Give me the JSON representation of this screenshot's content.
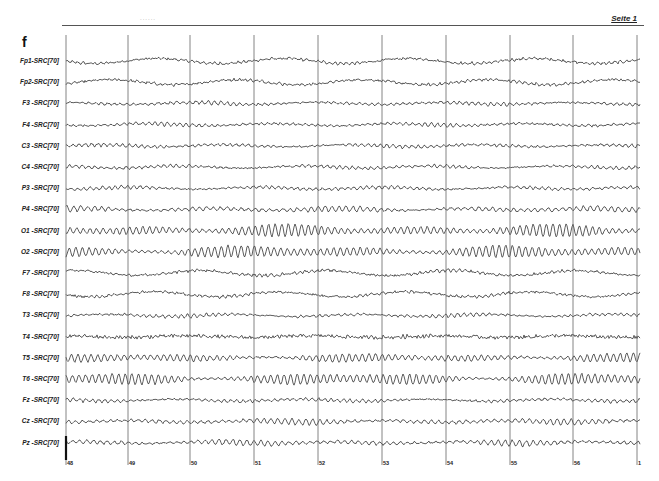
{
  "header": {
    "page_label": "Seite 1",
    "dots": "......"
  },
  "panel": {
    "letter": "f"
  },
  "montage": {
    "channels": [
      {
        "label": "Fp1-SRC[70]",
        "type": "slow"
      },
      {
        "label": "Fp2-SRC[70]",
        "type": "slow"
      },
      {
        "label": "F3 -SRC[70]",
        "type": "low"
      },
      {
        "label": "F4 -SRC[70]",
        "type": "low"
      },
      {
        "label": "C3 -SRC[70]",
        "type": "low"
      },
      {
        "label": "C4 -SRC[70]",
        "type": "low"
      },
      {
        "label": "P3 -SRC[70]",
        "type": "low"
      },
      {
        "label": "P4 -SRC[70]",
        "type": "mid"
      },
      {
        "label": "O1 -SRC[70]",
        "type": "alpha"
      },
      {
        "label": "O2 -SRC[70]",
        "type": "alpha"
      },
      {
        "label": "F7 -SRC[70]",
        "type": "slow"
      },
      {
        "label": "F8 -SRC[70]",
        "type": "slow"
      },
      {
        "label": "T3 -SRC[70]",
        "type": "low"
      },
      {
        "label": "T4 -SRC[70]",
        "type": "noisy"
      },
      {
        "label": "T5 -SRC[70]",
        "type": "alpha-mid"
      },
      {
        "label": "T6 -SRC[70]",
        "type": "alpha"
      },
      {
        "label": "Fz -SRC[70]",
        "type": "low"
      },
      {
        "label": "Cz -SRC[70]",
        "type": "mid"
      },
      {
        "label": "Pz -SRC[70]",
        "type": "mid"
      }
    ]
  },
  "time_axis": {
    "markers": [
      {
        "label": "48",
        "x": 66
      },
      {
        "label": "49",
        "x": 128
      },
      {
        "label": "50",
        "x": 190
      },
      {
        "label": "51",
        "x": 254
      },
      {
        "label": "52",
        "x": 318
      },
      {
        "label": "53",
        "x": 382
      },
      {
        "label": "54",
        "x": 446
      },
      {
        "label": "55",
        "x": 510
      },
      {
        "label": "56",
        "x": 573
      },
      {
        "label": "1",
        "x": 637
      }
    ]
  },
  "colors": {
    "trace": "#333333",
    "grid": "#666666",
    "background": "#ffffff"
  }
}
